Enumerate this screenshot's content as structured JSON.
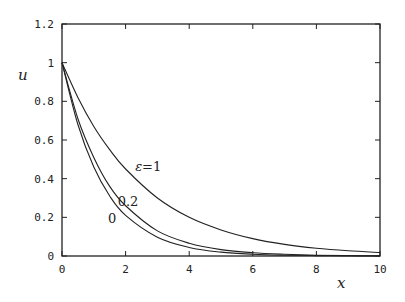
{
  "chart_data": {
    "type": "line",
    "title": "",
    "xlabel": "x",
    "ylabel": "u",
    "xlim": [
      0,
      10
    ],
    "ylim": [
      0,
      1.2
    ],
    "xticks": [
      0,
      2,
      4,
      6,
      8,
      10
    ],
    "yticks": [
      0,
      0.2,
      0.4,
      0.6,
      0.8,
      1,
      1.2
    ],
    "xtick_labels": [
      "0",
      "2",
      "4",
      "6",
      "8",
      "10"
    ],
    "ytick_labels": [
      "0",
      "0.2",
      "0.4",
      "0.6",
      "0.8",
      "1",
      "1.2"
    ],
    "grid": false,
    "legend": "none (inline curve labels)",
    "series": [
      {
        "name": "ε=1",
        "label": "ε=1",
        "x": [
          0,
          0.5,
          1,
          1.5,
          2,
          3,
          4,
          5,
          6,
          7,
          8,
          9,
          10
        ],
        "values": [
          1.0,
          0.82,
          0.67,
          0.55,
          0.45,
          0.3,
          0.2,
          0.135,
          0.09,
          0.06,
          0.04,
          0.027,
          0.018
        ]
      },
      {
        "name": "ε=0.2",
        "label": "0.2",
        "x": [
          0,
          0.5,
          1,
          1.5,
          2,
          3,
          4,
          5,
          6,
          7,
          8,
          9,
          10
        ],
        "values": [
          1.0,
          0.71,
          0.51,
          0.36,
          0.26,
          0.13,
          0.066,
          0.033,
          0.017,
          0.009,
          0.004,
          0.002,
          0.001
        ]
      },
      {
        "name": "ε=0",
        "label": "0",
        "x": [
          0,
          0.5,
          1,
          1.5,
          2,
          3,
          4,
          5,
          6,
          7,
          8,
          9,
          10
        ],
        "values": [
          1.0,
          0.68,
          0.46,
          0.31,
          0.21,
          0.097,
          0.044,
          0.02,
          0.009,
          0.004,
          0.002,
          0.001,
          0.0
        ]
      }
    ],
    "annotations": [
      {
        "text": "ε=1",
        "x": 2.3,
        "y": 0.44
      },
      {
        "text": "0.2",
        "x": 1.75,
        "y": 0.26
      },
      {
        "text": "0",
        "x": 1.45,
        "y": 0.17
      }
    ]
  },
  "axes": {
    "xlabel": "x",
    "ylabel": "u"
  }
}
